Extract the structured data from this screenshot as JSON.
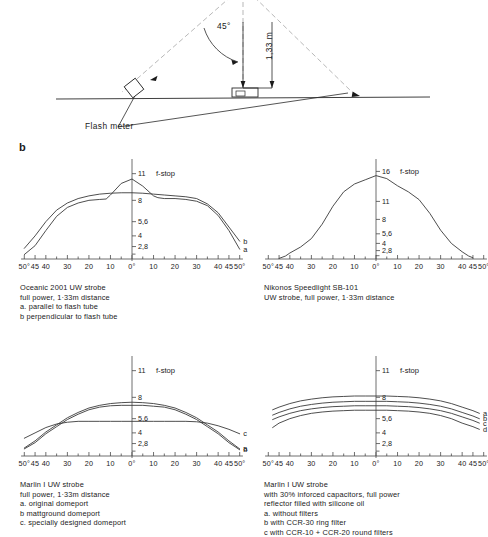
{
  "figure": {
    "panel_letter": "b",
    "diagram": {
      "angle_label": "45°",
      "distance_label": "1,33 m",
      "meter_label": "Flash meter"
    }
  },
  "chart_data": [
    {
      "id": "oceanic-2001",
      "type": "line",
      "title": "",
      "xlabel": "",
      "ylabel": "f-stop",
      "axis_title": "f-stop",
      "xticks": [
        "50°",
        "45",
        "40",
        "30",
        "20",
        "10",
        "0°",
        "10",
        "20",
        "30",
        "40",
        "45",
        "50°"
      ],
      "xtick_values": [
        -50,
        -45,
        -40,
        -30,
        -20,
        -10,
        0,
        10,
        20,
        30,
        40,
        45,
        50
      ],
      "yticks": [
        "11",
        "8",
        "5,6",
        "4",
        "2,8"
      ],
      "ytick_values": [
        11,
        8,
        5.6,
        4,
        2.8
      ],
      "xlim": [
        -52,
        52
      ],
      "ylim": [
        1.4,
        12.2
      ],
      "grid": false,
      "legend_position": "curve-end-labels",
      "series": [
        {
          "name": "a",
          "label": "a",
          "description": "parallel to flash tube",
          "x": [
            -50,
            -45,
            -40,
            -35,
            -30,
            -25,
            -20,
            -15,
            -12,
            -10,
            -5,
            0,
            5,
            10,
            12,
            15,
            20,
            25,
            30,
            35,
            40,
            45,
            50
          ],
          "y": [
            1.9,
            2.9,
            4.6,
            6.2,
            7.2,
            7.7,
            8.0,
            8.1,
            8.15,
            8.6,
            9.9,
            10.4,
            9.6,
            8.5,
            8.3,
            8.2,
            8.2,
            8.1,
            7.9,
            7.4,
            6.3,
            4.6,
            2.5
          ]
        },
        {
          "name": "b",
          "label": "b",
          "description": "perpendicular to flash tube",
          "x": [
            -50,
            -45,
            -40,
            -35,
            -30,
            -25,
            -20,
            -15,
            -10,
            -5,
            0,
            5,
            10,
            15,
            20,
            25,
            30,
            35,
            40,
            45,
            50
          ],
          "y": [
            2.6,
            4.0,
            5.6,
            6.9,
            7.7,
            8.2,
            8.5,
            8.7,
            8.8,
            8.85,
            8.85,
            8.8,
            8.7,
            8.6,
            8.5,
            8.4,
            8.2,
            7.6,
            6.6,
            5.0,
            3.4
          ]
        }
      ],
      "caption": [
        "Oceanic  2001  UW strobe",
        "full power,   1·33m distance",
        "a. parallel to flash tube",
        "b perpendicular to flash tube"
      ]
    },
    {
      "id": "nikonos-sb101",
      "type": "line",
      "title": "",
      "xlabel": "",
      "ylabel": "f-stop",
      "axis_title": "f-stop",
      "xticks": [
        "50°",
        "45",
        "40",
        "30",
        "20",
        "10",
        "0°",
        "10",
        "20",
        "30",
        "40",
        "45",
        "50°"
      ],
      "xtick_values": [
        -50,
        -45,
        -40,
        -30,
        -20,
        -10,
        0,
        10,
        20,
        30,
        40,
        45,
        50
      ],
      "yticks": [
        "16",
        "11",
        "8",
        "5,6",
        "4",
        "2,8"
      ],
      "ytick_values": [
        16,
        11,
        8,
        5.6,
        4,
        2.8
      ],
      "xlim": [
        -52,
        52
      ],
      "ylim": [
        1.4,
        17.4
      ],
      "grid": false,
      "legend_position": "none",
      "series": [
        {
          "name": "sb101",
          "label": "",
          "description": "Nikonos Speedlight SB-101 UW strobe, full power, 1,33 m distance",
          "x": [
            -45,
            -42,
            -40,
            -35,
            -30,
            -25,
            -20,
            -15,
            -10,
            -5,
            0,
            5,
            10,
            15,
            20,
            25,
            30,
            35,
            40,
            43,
            45
          ],
          "y": [
            1.5,
            1.9,
            2.4,
            3.4,
            4.8,
            7.2,
            10.2,
            12.6,
            13.9,
            14.6,
            15.3,
            14.8,
            13.6,
            12.6,
            11.3,
            9.0,
            6.2,
            4.0,
            2.6,
            1.9,
            1.6
          ]
        }
      ],
      "caption": [
        "Nikonos  Speedlight  SB-101",
        "UW strobe, full power,  1·33m distance"
      ]
    },
    {
      "id": "marlin-i-domeports",
      "type": "line",
      "title": "",
      "xlabel": "",
      "ylabel": "f-stop",
      "axis_title": "f-stop",
      "xticks": [
        "50°",
        "45",
        "40",
        "30",
        "20",
        "10",
        "0°",
        "10",
        "20",
        "30",
        "40",
        "45",
        "50°"
      ],
      "xtick_values": [
        -50,
        -45,
        -40,
        -30,
        -20,
        -10,
        0,
        10,
        20,
        30,
        40,
        45,
        50
      ],
      "yticks": [
        "11",
        "8",
        "5,6",
        "4",
        "2,8"
      ],
      "ytick_values": [
        11,
        8,
        5.6,
        4,
        2.8
      ],
      "xlim": [
        -52,
        52
      ],
      "ylim": [
        1.4,
        12.2
      ],
      "grid": false,
      "legend_position": "curve-end-labels",
      "series": [
        {
          "name": "a",
          "label": "a",
          "description": "original domeport",
          "x": [
            -50,
            -45,
            -40,
            -35,
            -30,
            -25,
            -20,
            -15,
            -10,
            -5,
            0,
            5,
            10,
            15,
            20,
            25,
            30,
            35,
            40,
            45,
            50
          ],
          "y": [
            2.3,
            3.1,
            4.1,
            4.9,
            5.7,
            6.3,
            6.8,
            7.1,
            7.3,
            7.4,
            7.45,
            7.4,
            7.3,
            7.1,
            6.8,
            6.3,
            5.7,
            4.9,
            4.1,
            3.1,
            2.2
          ]
        },
        {
          "name": "b",
          "label": "b",
          "description": "matt ground domeport",
          "x": [
            -50,
            -45,
            -40,
            -35,
            -30,
            -25,
            -20,
            -15,
            -10,
            -5,
            0,
            5,
            10,
            15,
            20,
            25,
            30,
            35,
            40,
            45,
            50
          ],
          "y": [
            2.2,
            2.9,
            3.9,
            4.7,
            5.5,
            6.1,
            6.6,
            6.9,
            7.05,
            7.1,
            7.1,
            7.1,
            7.0,
            6.9,
            6.6,
            6.1,
            5.5,
            4.7,
            3.9,
            2.9,
            2.1
          ]
        },
        {
          "name": "c",
          "label": "c",
          "description": "specially designed domeport",
          "x": [
            -50,
            -45,
            -40,
            -35,
            -30,
            -25,
            -20,
            -15,
            -10,
            -5,
            0,
            5,
            10,
            15,
            20,
            25,
            30,
            35,
            40,
            45,
            50
          ],
          "y": [
            3.4,
            4.0,
            4.6,
            5.0,
            5.2,
            5.3,
            5.3,
            5.3,
            5.3,
            5.3,
            5.3,
            5.3,
            5.3,
            5.3,
            5.3,
            5.3,
            5.25,
            5.1,
            4.8,
            4.4,
            3.9
          ]
        }
      ],
      "caption": [
        "Marlin I    UW strobe",
        "full power,   1·33m distance",
        "a. original  domeport",
        "b mattground  domeport",
        "c. specially designed  domeport"
      ]
    },
    {
      "id": "marlin-i-filters",
      "type": "line",
      "title": "",
      "xlabel": "",
      "ylabel": "f-stop",
      "axis_title": "f-stop",
      "xticks": [
        "50°",
        "45",
        "40",
        "30",
        "20",
        "10",
        "0°",
        "10",
        "20",
        "30",
        "40",
        "45",
        "50°"
      ],
      "xtick_values": [
        -50,
        -45,
        -40,
        -30,
        -20,
        -10,
        0,
        10,
        20,
        30,
        40,
        45,
        50
      ],
      "yticks": [
        "11",
        "8",
        "5,6",
        "4",
        "2,8"
      ],
      "ytick_values": [
        11,
        8,
        5.6,
        4,
        2.8
      ],
      "xlim": [
        -52,
        52
      ],
      "ylim": [
        1.4,
        12.2
      ],
      "grid": false,
      "legend_position": "curve-end-labels",
      "series": [
        {
          "name": "a",
          "label": "a",
          "description": "without filters",
          "x": [
            -48,
            -45,
            -40,
            -35,
            -30,
            -25,
            -20,
            -15,
            -10,
            -5,
            0,
            5,
            10,
            15,
            20,
            25,
            30,
            35,
            40,
            45,
            48
          ],
          "y": [
            6.6,
            6.9,
            7.3,
            7.6,
            7.8,
            7.95,
            8.05,
            8.1,
            8.15,
            8.15,
            8.15,
            8.15,
            8.1,
            8.05,
            7.95,
            7.8,
            7.6,
            7.3,
            6.9,
            6.5,
            6.2
          ]
        },
        {
          "name": "b",
          "label": "b",
          "description": "with CCR-30 ring filter",
          "x": [
            -48,
            -45,
            -40,
            -35,
            -30,
            -25,
            -20,
            -15,
            -10,
            -5,
            0,
            5,
            10,
            15,
            20,
            25,
            30,
            35,
            40,
            45,
            48
          ],
          "y": [
            6.0,
            6.3,
            6.7,
            7.0,
            7.2,
            7.35,
            7.45,
            7.5,
            7.55,
            7.55,
            7.55,
            7.55,
            7.5,
            7.45,
            7.35,
            7.2,
            7.0,
            6.7,
            6.3,
            5.9,
            5.6
          ]
        },
        {
          "name": "c",
          "label": "c",
          "description": "with CCR-10 + CCR-20 round filters",
          "x": [
            -48,
            -45,
            -40,
            -35,
            -30,
            -25,
            -20,
            -15,
            -10,
            -5,
            0,
            5,
            10,
            15,
            20,
            25,
            30,
            35,
            40,
            45,
            48
          ],
          "y": [
            5.5,
            5.8,
            6.2,
            6.5,
            6.7,
            6.85,
            6.95,
            7.0,
            7.05,
            7.05,
            7.05,
            7.05,
            7.0,
            6.95,
            6.85,
            6.7,
            6.5,
            6.2,
            5.8,
            5.4,
            5.1
          ]
        },
        {
          "name": "d",
          "label": "d",
          "description": "combination of all 3 filters",
          "x": [
            -48,
            -45,
            -40,
            -35,
            -30,
            -25,
            -20,
            -15,
            -10,
            -5,
            0,
            5,
            10,
            15,
            20,
            25,
            30,
            35,
            40,
            45,
            48
          ],
          "y": [
            4.6,
            5.1,
            5.6,
            5.95,
            6.2,
            6.35,
            6.45,
            6.5,
            6.55,
            6.55,
            6.55,
            6.55,
            6.5,
            6.45,
            6.35,
            6.2,
            5.95,
            5.6,
            5.1,
            4.7,
            4.4
          ]
        }
      ],
      "caption": [
        "Marlin I   UW strobe",
        "with 30%  inforced capacitors, full power",
        "reflector  filled with silicone  oil",
        "a. without  filters",
        "b with CCR-30  ring filter",
        "c with CCR-10 + CCR-20 round  filters",
        "d combination  of  all  3 filters"
      ]
    }
  ]
}
